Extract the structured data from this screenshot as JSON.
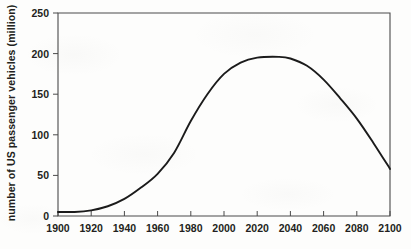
{
  "chart_data": {
    "type": "line",
    "title": "",
    "xlabel": "",
    "ylabel": "number of US passenger vehicles (million)",
    "xlim": [
      1900,
      2100
    ],
    "ylim": [
      0,
      250
    ],
    "xticks": [
      1900,
      1920,
      1940,
      1960,
      1980,
      2000,
      2020,
      2040,
      2060,
      2080,
      2100
    ],
    "yticks": [
      0,
      50,
      100,
      150,
      200,
      250
    ],
    "grid": false,
    "legend": null,
    "series": [
      {
        "name": "US passenger vehicles",
        "color": "#1b1b1b",
        "x": [
          1900,
          1910,
          1920,
          1930,
          1940,
          1950,
          1960,
          1970,
          1980,
          1990,
          2000,
          2010,
          2020,
          2033,
          2040,
          2050,
          2060,
          2070,
          2080,
          2090,
          2100
        ],
        "values": [
          5,
          5,
          7,
          12,
          21,
          35,
          52,
          78,
          117,
          150,
          175,
          189,
          195,
          196,
          194,
          185,
          168,
          145,
          120,
          90,
          58
        ]
      }
    ],
    "peak": {
      "x": 2033,
      "y": 196
    }
  },
  "axes": {
    "y_tick_labels": [
      "0",
      "50",
      "100",
      "150",
      "200",
      "250"
    ],
    "x_tick_labels": [
      "1900",
      "1920",
      "1940",
      "1960",
      "1980",
      "2000",
      "2020",
      "2040",
      "2060",
      "2080",
      "2100"
    ],
    "y_axis_title": "number of US passenger vehicles (million)"
  },
  "colors": {
    "curve": "#1b1b1b",
    "axis": "#4a4a4a",
    "text": "#231f20",
    "background": "#fdfdfc"
  }
}
